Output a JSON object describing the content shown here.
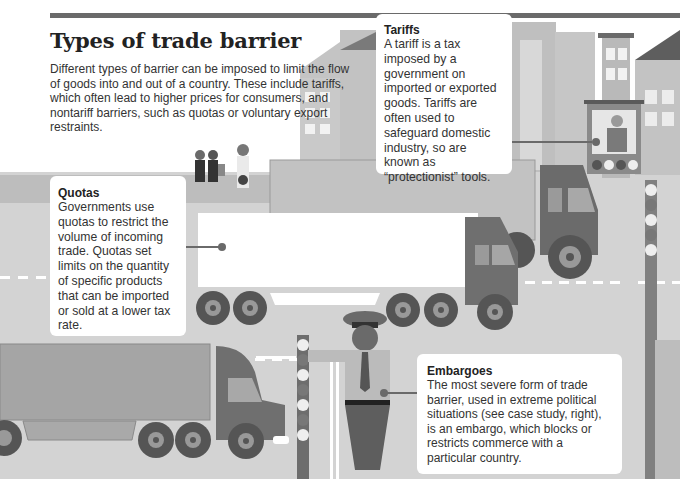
{
  "header": {
    "title": "Types of trade barrier",
    "intro": "Different types of barrier can be imposed to limit the flow of goods into and out of a country. These include tariffs, which often lead to higher prices for consumers, and nontariff barriers, such as quotas or voluntary export restraints."
  },
  "cards": {
    "tariffs": {
      "heading": "Tariffs",
      "body": "A tariff is a tax imposed by a government on imported or exported goods. Tariffs are often used to safeguard domestic industry, so are known as “protectionist” tools."
    },
    "quotas": {
      "heading": "Quotas",
      "body": "Governments use quotas to restrict the volume of incoming trade. Quotas set limits on the quantity of specific products that can be imported or sold at a lower tax rate."
    },
    "embargoes": {
      "heading": "Embargoes",
      "body": "The most severe form of trade barrier, used in extreme political situations (see case study, right), is an embargo, which blocks or restricts commerce with a particular country."
    }
  },
  "illustration": {
    "elements": [
      "city-buildings",
      "pedestrians",
      "white-trailer-truck",
      "rear-truck",
      "left-truck",
      "customs-officer",
      "toll-booth-worker",
      "boom-barrier"
    ],
    "palette": {
      "road": "#d0d0d0",
      "building": "#b8b8b8",
      "truck_cab": "#6e6e6e",
      "wheel": "#555555",
      "card": "#ffffff"
    }
  }
}
